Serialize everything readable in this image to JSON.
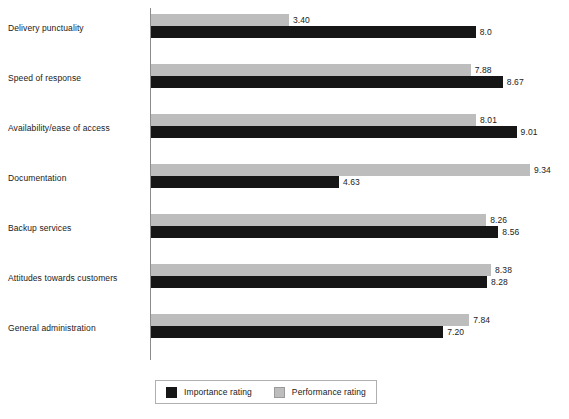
{
  "chart_data": {
    "type": "bar",
    "orientation": "horizontal",
    "title": "",
    "xlabel": "",
    "ylabel": "",
    "xlim": [
      0,
      9.34
    ],
    "grid": false,
    "legend_position": "bottom",
    "categories": [
      "Delivery punctuality",
      "Speed of response",
      "Availability/ease of access",
      "Documentation",
      "Backup services",
      "Attitudes towards customers",
      "General administration"
    ],
    "series": [
      {
        "name": "Importance rating",
        "color": "#161616",
        "values": [
          8.0,
          8.67,
          9.01,
          4.63,
          8.56,
          8.28,
          7.2
        ],
        "labels": [
          "8.0",
          "8.67",
          "9.01",
          "4.63",
          "8.56",
          "8.28",
          "7.20"
        ]
      },
      {
        "name": "Performance rating",
        "color": "#bdbdbd",
        "values": [
          3.4,
          7.88,
          8.01,
          9.34,
          8.26,
          8.38,
          7.84
        ],
        "labels": [
          "3.40",
          "7.88",
          "8.01",
          "9.34",
          "8.26",
          "8.38",
          "7.84"
        ]
      }
    ]
  },
  "legend": {
    "items": [
      {
        "label": "Importance rating",
        "swatch": "importance-swatch"
      },
      {
        "label": "Performance rating",
        "swatch": "performance-swatch"
      }
    ]
  },
  "axis": {
    "line_color": "#8c8c8c"
  }
}
